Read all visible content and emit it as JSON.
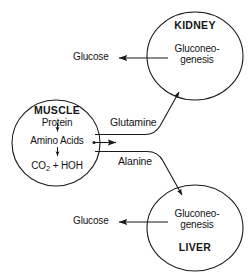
{
  "diagram": {
    "type": "flow-diagram",
    "background_color": "#ffffff",
    "stroke_color": "#1a1a1a",
    "text_color": "#141414"
  },
  "organs": {
    "kidney": {
      "name": "KIDNEY",
      "process_line1": "Gluconeo-",
      "process_line2": "genesis",
      "output_label": "Glucose",
      "label_position": "top",
      "shape": "ellipse",
      "cx": 195,
      "cy": 56,
      "rx": 48,
      "ry": 44
    },
    "muscle": {
      "name": "MUSCLE",
      "substrate": "Protein",
      "intermediate": "Amino Acids",
      "product_formula": "CO",
      "product_subscript": "2",
      "product_rest": " + HOH",
      "label_position": "top",
      "shape": "ellipse",
      "cx": 56,
      "cy": 143,
      "rx": 44,
      "ry": 43
    },
    "liver": {
      "name": "LIVER",
      "process_line1": "Gluconeo-",
      "process_line2": "genesis",
      "output_label": "Glucose",
      "label_position": "bottom",
      "shape": "ellipse",
      "cx": 195,
      "cy": 228,
      "rx": 48,
      "ry": 43
    }
  },
  "pathways": [
    {
      "label": "Glutamine",
      "from": "muscle",
      "to": "kidney",
      "direction": "up-right"
    },
    {
      "label": "Alanine",
      "from": "muscle",
      "to": "liver",
      "direction": "down-right"
    }
  ],
  "internal_arrows": {
    "muscle_protein_to_amino": "down-arrow",
    "muscle_amino_to_co2": "down-arrow",
    "muscle_amino_out": "right-arrow"
  },
  "outputs": [
    {
      "label": "Glucose",
      "source": "kidney",
      "direction": "left"
    },
    {
      "label": "Glucose",
      "source": "liver",
      "direction": "left"
    }
  ]
}
